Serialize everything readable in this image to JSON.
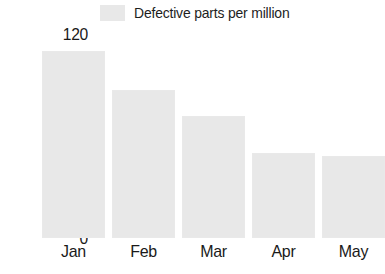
{
  "legend": {
    "swatch_color": "#e8e8e8",
    "label": "Defective parts per million"
  },
  "axes": {
    "y_ticks": [
      "120",
      "100",
      "80",
      "60",
      "40",
      "20",
      "0"
    ],
    "x_ticks": [
      "Jan",
      "Feb",
      "Mar",
      "Apr",
      "May"
    ]
  },
  "chart_data": {
    "type": "bar",
    "title": "",
    "subtitle": "",
    "xlabel": "",
    "ylabel": "",
    "categories": [
      "Jan",
      "Feb",
      "Mar",
      "Apr",
      "May"
    ],
    "values": [
      110,
      87,
      72,
      50,
      48
    ],
    "series": [
      {
        "name": "Defective parts per million",
        "values": [
          110,
          87,
          72,
          50,
          48
        ],
        "color": "#e8e8e8"
      }
    ],
    "ylim": [
      0,
      120
    ],
    "ytick_step": 20,
    "ytick_values": [
      0,
      20,
      40,
      60,
      80,
      100,
      120
    ],
    "grid": false,
    "legend_position": "top-center",
    "axis_line": false
  }
}
